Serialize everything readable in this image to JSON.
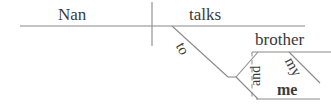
{
  "diagram": {
    "type": "reed-kellogg-sentence-diagram",
    "sentence": "Nan talks to my brother and me",
    "stroke_color": "#8a8a8a",
    "text_color": "#3a3a3a",
    "background_color": "#ffffff",
    "words": {
      "subject": "Nan",
      "verb": "talks",
      "preposition": "to",
      "conjunction": "and",
      "object_one": "brother",
      "modifier": "my",
      "object_two": "me"
    },
    "lines": {
      "main_baseline": {
        "x1": 20,
        "y1": 26,
        "x2": 305,
        "y2": 26
      },
      "subject_verb_divider": {
        "x1": 152,
        "y1": 2,
        "x2": 152,
        "y2": 46
      },
      "preposition_slant": {
        "x1": 172,
        "y1": 26,
        "x2": 228,
        "y2": 77
      },
      "prep_stub": {
        "x1": 228,
        "y1": 77,
        "x2": 236,
        "y2": 77
      },
      "fork_upper": {
        "x1": 236,
        "y1": 77,
        "x2": 258,
        "y2": 52
      },
      "fork_lower": {
        "x1": 236,
        "y1": 77,
        "x2": 258,
        "y2": 99
      },
      "object_one_baseline": {
        "x1": 252,
        "y1": 52,
        "x2": 330,
        "y2": 52
      },
      "object_two_baseline": {
        "x1": 256,
        "y1": 99,
        "x2": 320,
        "y2": 99
      },
      "modifier_slant": {
        "x1": 289,
        "y1": 52,
        "x2": 320,
        "y2": 83
      },
      "conjunction_dashed": {
        "x1": 252,
        "y1": 52,
        "x2": 252,
        "y2": 99
      }
    }
  }
}
